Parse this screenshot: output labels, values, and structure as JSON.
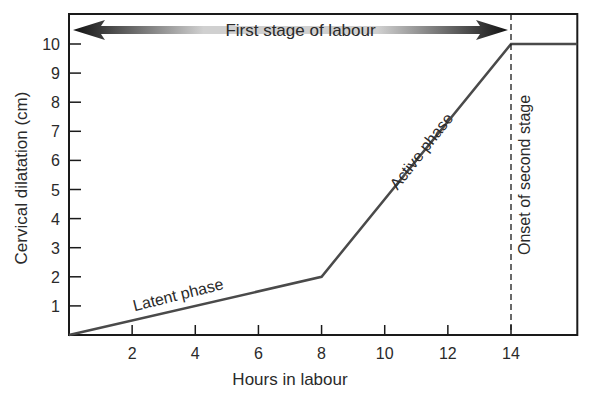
{
  "chart_data": {
    "type": "line",
    "title": "",
    "xlabel": "Hours in labour",
    "ylabel": "Cervical dilatation (cm)",
    "xlim": [
      0,
      16.1
    ],
    "ylim": [
      0,
      11
    ],
    "x_ticks": [
      2,
      4,
      6,
      8,
      10,
      12,
      14
    ],
    "y_ticks": [
      1,
      2,
      3,
      4,
      5,
      6,
      7,
      8,
      9,
      10
    ],
    "grid": false,
    "legend": null,
    "series": [
      {
        "name": "Cervical dilatation",
        "points": [
          [
            0,
            0
          ],
          [
            8,
            2
          ],
          [
            14,
            10
          ],
          [
            16.1,
            10
          ]
        ]
      }
    ],
    "annotations": [
      {
        "text": "First stage of labour",
        "type": "double-arrow",
        "x_range": [
          0,
          14
        ],
        "y": 10.7
      },
      {
        "text": "Latent phase",
        "x": 3.5,
        "y": 1.2,
        "rotation": -14
      },
      {
        "text": "Active phase",
        "x": 11.3,
        "y": 6.2,
        "rotation": -52
      },
      {
        "text": "Onset of second stage",
        "x": 14.6,
        "y": 5.5,
        "rotation": -90
      },
      {
        "type": "vertical-dashed-line",
        "x": 14
      }
    ],
    "colors": {
      "line": "#4a4a4a",
      "axis": "#1a1a1a",
      "arrow_dark": "#1a1a1a",
      "arrow_light": "#c8c8c8"
    }
  }
}
